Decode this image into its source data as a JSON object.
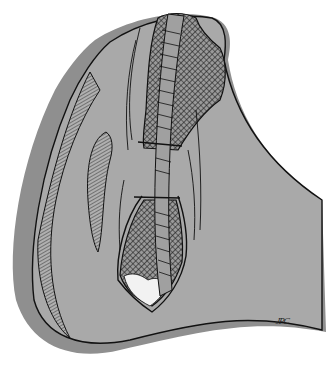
{
  "illustration": {
    "subject": "surgical-wound-closure-with-mesh-and-sutures",
    "signature": "JPC",
    "colors": {
      "background": "#ffffff",
      "skin_gray": "#a9a9a9",
      "shadow_gray": "#8f8f8f",
      "mesh_dark": "#2a2a2a",
      "line": "#111111",
      "tissue_light": "#f2f2f2"
    }
  }
}
